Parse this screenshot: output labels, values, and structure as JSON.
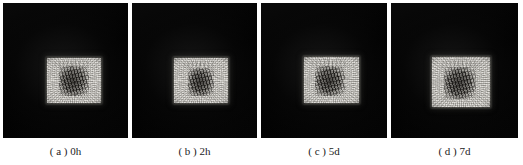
{
  "figure": {
    "type": "image-panel-series",
    "panel_count": 4,
    "background_color": "#ffffff",
    "panel_background_color": "#000000",
    "sample_color": "#cfcdc6",
    "blotch_color": "#161412",
    "caption_color": "#1b1b1b",
    "panels": [
      {
        "id": "panel-a",
        "label": "( a ) 0h",
        "letter": "a",
        "time": "0h",
        "frame": {
          "x": 3,
          "y": 3,
          "width": 125,
          "height": 135
        },
        "sample": {
          "x": 44,
          "y": 55,
          "width": 54,
          "height": 45
        },
        "blotch": {
          "x": 12,
          "y": 8,
          "width": 30,
          "height": 30
        },
        "top_mark": {
          "x": 8,
          "y": 2,
          "width": 36,
          "height": 8
        }
      },
      {
        "id": "panel-b",
        "label": "( b ) 2h",
        "letter": "b",
        "time": "2h",
        "frame": {
          "x": 132,
          "y": 3,
          "width": 125,
          "height": 135
        },
        "sample": {
          "x": 42,
          "y": 55,
          "width": 54,
          "height": 45
        },
        "blotch": {
          "x": 14,
          "y": 10,
          "width": 26,
          "height": 28
        },
        "top_mark": {
          "x": 10,
          "y": 3,
          "width": 32,
          "height": 7
        }
      },
      {
        "id": "panel-c",
        "label": "( c ) 5d",
        "letter": "c",
        "time": "5d",
        "frame": {
          "x": 261,
          "y": 3,
          "width": 126,
          "height": 135
        },
        "sample": {
          "x": 43,
          "y": 54,
          "width": 55,
          "height": 46
        },
        "blotch": {
          "x": 11,
          "y": 9,
          "width": 30,
          "height": 30
        },
        "top_mark": {
          "x": 8,
          "y": 2,
          "width": 34,
          "height": 8
        }
      },
      {
        "id": "panel-d",
        "label": "( d ) 7d",
        "letter": "d",
        "time": "7d",
        "frame": {
          "x": 391,
          "y": 3,
          "width": 127,
          "height": 135
        },
        "sample": {
          "x": 41,
          "y": 54,
          "width": 58,
          "height": 50
        },
        "blotch": {
          "x": 12,
          "y": 10,
          "width": 32,
          "height": 32
        },
        "top_mark": {
          "x": 10,
          "y": 3,
          "width": 36,
          "height": 8
        }
      }
    ]
  }
}
